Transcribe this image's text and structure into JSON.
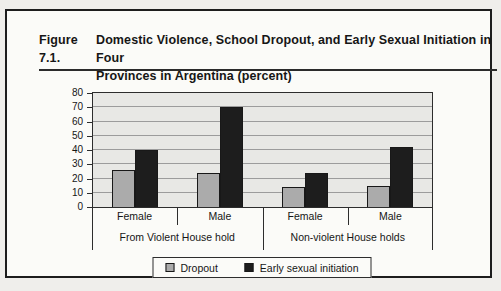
{
  "figure": {
    "label": "Figure 7.1.",
    "title_line1": "Domestic Violence, School Dropout, and Early Sexual Initiation in Four",
    "title_line2": "Provinces in Argentina (percent)"
  },
  "chart_data": {
    "type": "bar",
    "title": "Domestic Violence, School Dropout, and Early Sexual Initiation in Four Provinces in Argentina (percent)",
    "categories": [
      "Female",
      "Male",
      "Female",
      "Male"
    ],
    "group_labels": [
      "From Violent House hold",
      "Non-violent House holds"
    ],
    "series": [
      {
        "name": "Dropout",
        "color": "#ababab",
        "values": [
          26,
          24,
          14,
          15
        ]
      },
      {
        "name": "Early sexual initiation",
        "color": "#1d1d1d",
        "values": [
          40,
          70,
          24,
          42
        ]
      }
    ],
    "ylim": [
      0,
      80
    ],
    "yticks": [
      0,
      10,
      20,
      30,
      40,
      50,
      60,
      70,
      80
    ],
    "grid": true,
    "legend_position": "bottom"
  },
  "colors": {
    "page_bg": "#efeeeb",
    "figure_bg": "#fbfbf8",
    "border": "#1d1d1d",
    "plot_bg": "#e8e8e5",
    "gridline": "#9c9c9c",
    "text": "#161616"
  }
}
